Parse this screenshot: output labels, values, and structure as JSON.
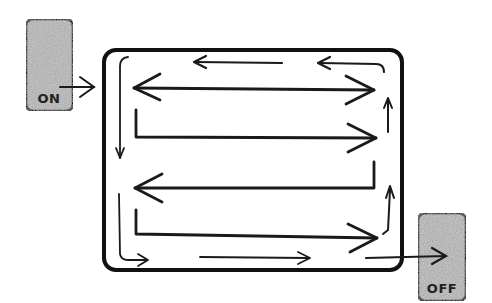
{
  "diagram": {
    "start_switch": {
      "label": "ON",
      "fill": "#b8b8b8"
    },
    "end_switch": {
      "label": "OFF",
      "fill": "#b8b8b8"
    },
    "stroke_color": "#1a1a1a",
    "background": "#ffffff"
  }
}
